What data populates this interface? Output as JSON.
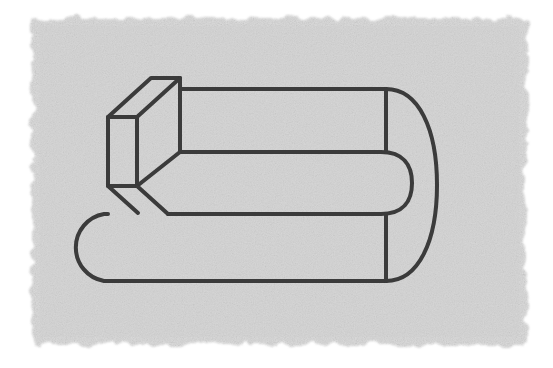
{
  "page": {
    "width": 553,
    "height": 368,
    "background_color": "#ffffff"
  },
  "panel": {
    "name": "textured-paper-panel",
    "fill_color": "#dcdcdc",
    "noise_color": "#c9c9c9",
    "highlight_color": "#e8e8e8",
    "x": 32,
    "y": 18,
    "width": 495,
    "height": 327,
    "edge_style": "deckled-soft"
  },
  "drawing": {
    "name": "hairpin-pipe-with-block",
    "description": "Line drawing of a U-shaped flat bar bent back on itself, with a rectangular block resting on the upper arm at the left end",
    "stroke_color": "#3a3a3a",
    "stroke_width": 4,
    "fill_color": "none",
    "line_cap": "round",
    "line_join": "round"
  },
  "geometry": {
    "upper_arm": {
      "name": "upper-arm",
      "top_edge_y": 89,
      "bottom_edge_y": 152,
      "left_x": 180,
      "right_x": 386
    },
    "lower_arm": {
      "name": "lower-arm",
      "top_edge_y": 214,
      "bottom_edge_y": 281,
      "left_x": 70,
      "right_x": 386
    },
    "left_cap": {
      "name": "left-rounded-cap",
      "center_x": 104,
      "center_y": 247,
      "radius": 34
    },
    "right_bend": {
      "name": "right-u-bend",
      "outer_x": 437,
      "inner_tip_x": 412,
      "outer_center_y": 185,
      "outer_radius": 96,
      "inner_radius": 31
    },
    "dividers": [
      {
        "name": "upper-divider-line",
        "x": 386,
        "y1": 89,
        "y2": 152
      },
      {
        "name": "lower-divider-line",
        "x": 386,
        "y1": 214,
        "y2": 281
      }
    ],
    "block": {
      "name": "rectangular-block",
      "front_face": {
        "left": 108,
        "right": 137,
        "top": 117,
        "bottom": 186
      },
      "depth_dx": 43,
      "depth_dy": -39,
      "top_back_left_x": 151,
      "top_back_left_y": 78,
      "top_back_right_x": 180,
      "top_back_right_y": 78
    }
  },
  "labels": {
    "figure_caption": "",
    "alt_text": "Three-dimensional line drawing of a hairpin-shaped bar with a cuboid block at its left end"
  }
}
